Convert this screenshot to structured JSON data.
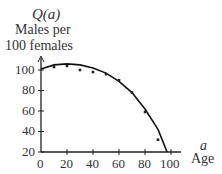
{
  "chart_data": {
    "type": "scatter",
    "title": "",
    "ylabel_symbol": "Q(a)",
    "ylabel_line1": "Males per",
    "ylabel_line2": "100 females",
    "xlabel_symbol": "a",
    "xlabel": "Age",
    "xticks": [
      0,
      20,
      40,
      60,
      80,
      100
    ],
    "yticks": [
      20,
      40,
      60,
      80,
      100
    ],
    "xlim": [
      0,
      100
    ],
    "ylim": [
      20,
      110
    ],
    "grid": false,
    "series": [
      {
        "name": "observed",
        "kind": "points",
        "x": [
          10,
          20,
          30,
          40,
          50,
          60,
          70,
          80,
          90
        ],
        "y": [
          103,
          104,
          100,
          98,
          96,
          90,
          78,
          59,
          32
        ]
      },
      {
        "name": "fitted curve",
        "kind": "line",
        "x": [
          0,
          10,
          20,
          30,
          40,
          50,
          60,
          70,
          80,
          90,
          97
        ],
        "y": [
          101,
          105,
          106,
          105,
          102,
          97,
          89,
          78,
          62,
          42,
          20
        ]
      }
    ]
  }
}
